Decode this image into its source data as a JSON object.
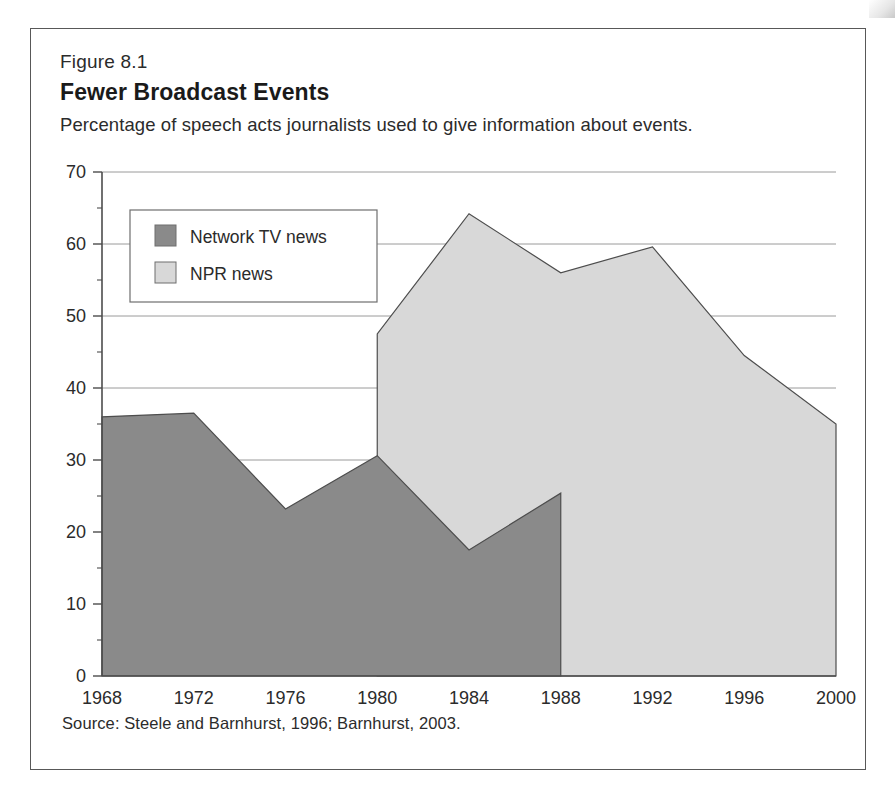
{
  "figure": {
    "number": "Figure 8.1",
    "title": "Fewer Broadcast Events",
    "subtitle": "Percentage of speech acts journalists used to give information about events.",
    "source": "Source: Steele and Barnhurst, 1996; Barnhurst, 2003."
  },
  "colors": {
    "network_tv": "#8a8a8a",
    "npr": "#d8d8d8",
    "line": "#4d4d4d",
    "grid": "#9a9a9a",
    "axis": "#4d4d4d",
    "text": "#2b2b2b",
    "frame": "#585858"
  },
  "legend": {
    "items": [
      {
        "label": "Network TV news",
        "color": "#8a8a8a"
      },
      {
        "label": "NPR news",
        "color": "#d8d8d8"
      }
    ]
  },
  "chart_data": {
    "type": "area",
    "title": "Fewer Broadcast Events",
    "subtitle": "Percentage of speech acts journalists used to give information about events.",
    "xlabel": "",
    "ylabel": "",
    "x": [
      1968,
      1972,
      1976,
      1980,
      1984,
      1988,
      1992,
      1996,
      2000
    ],
    "categories": [
      "1968",
      "1972",
      "1976",
      "1980",
      "1984",
      "1988",
      "1992",
      "1996",
      "2000"
    ],
    "xlim": [
      1968,
      2000
    ],
    "ylim": [
      0,
      70
    ],
    "yticks": [
      0,
      10,
      20,
      30,
      40,
      50,
      60,
      70
    ],
    "ytick_labels": [
      "0",
      "10",
      "20",
      "30",
      "40",
      "50",
      "60",
      "70"
    ],
    "yminor_step": 5,
    "grid": true,
    "legend_position": "upper-left-inside",
    "series": [
      {
        "name": "Network TV news",
        "color": "#8a8a8a",
        "x": [
          1968,
          1972,
          1976,
          1980,
          1984,
          1988
        ],
        "values": [
          36.0,
          36.5,
          23.2,
          30.6,
          17.5,
          25.4
        ]
      },
      {
        "name": "NPR news",
        "color": "#d8d8d8",
        "x": [
          1980,
          1984,
          1988,
          1992,
          1996,
          2000
        ],
        "values": [
          47.5,
          64.2,
          56.0,
          59.6,
          44.5,
          35.0
        ]
      }
    ],
    "source": "Source: Steele and Barnhurst, 1996; Barnhurst, 2003."
  }
}
